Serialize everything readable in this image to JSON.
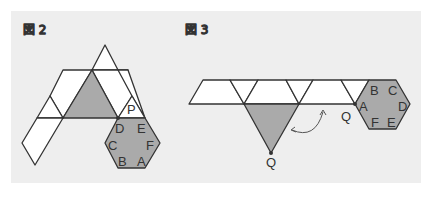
{
  "figures": [
    {
      "title": "図 2",
      "hexagon_labels": [
        "D",
        "E",
        "F",
        "A",
        "B",
        "C"
      ],
      "point_label": "P"
    },
    {
      "title": "図 3",
      "hexagon_labels": [
        "B",
        "C",
        "D",
        "E",
        "F",
        "A"
      ],
      "point_label_on_strip": "Q",
      "point_label_triangle": "Q"
    }
  ],
  "colors": {
    "background": "#eeeeee",
    "shade": "#aaaaaa",
    "stroke": "#333333",
    "face": "#ffffff"
  }
}
